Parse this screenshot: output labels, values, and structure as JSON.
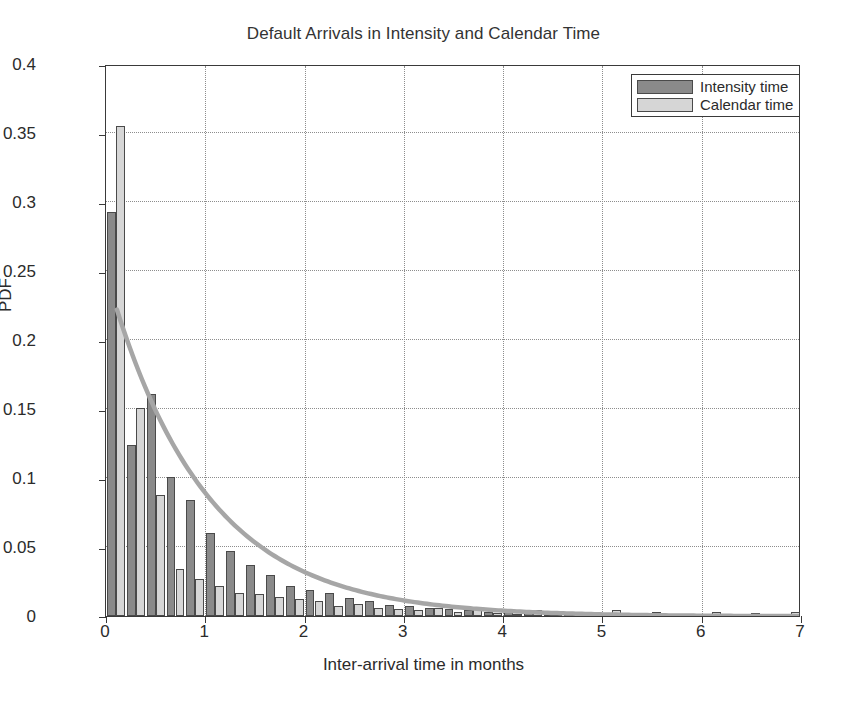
{
  "chart_data": {
    "type": "bar",
    "title": "Default Arrivals in Intensity and Calendar Time",
    "xlabel": "Inter-arrival time in months",
    "ylabel": "PDF",
    "xlim": [
      0,
      7
    ],
    "ylim": [
      0,
      0.4
    ],
    "xticks": [
      "0",
      "1",
      "2",
      "3",
      "4",
      "5",
      "6",
      "7"
    ],
    "xtick_values": [
      0,
      1,
      2,
      3,
      4,
      5,
      6,
      7
    ],
    "yticks": [
      "0",
      "0.05",
      "0.1",
      "0.15",
      "0.2",
      "0.25",
      "0.3",
      "0.35",
      "0.4"
    ],
    "ytick_values": [
      0,
      0.05,
      0.1,
      0.15,
      0.2,
      0.25,
      0.3,
      0.35,
      0.4
    ],
    "grid": true,
    "grid_style": "dotted",
    "bin_width": 0.2,
    "bin_centers": [
      0.1,
      0.3,
      0.5,
      0.7,
      0.9,
      1.1,
      1.3,
      1.5,
      1.7,
      1.9,
      2.1,
      2.3,
      2.5,
      2.7,
      2.9,
      3.1,
      3.3,
      3.5,
      3.7,
      3.9,
      4.1,
      4.3,
      4.5,
      4.7,
      4.9,
      5.1,
      5.3,
      5.5,
      5.7,
      5.9,
      6.1,
      6.3,
      6.5,
      6.7,
      6.9
    ],
    "legend_position": "top-right",
    "series": [
      {
        "name": "Intensity time",
        "color": "#8a8a8a",
        "values": [
          0.293,
          0.124,
          0.161,
          0.101,
          0.084,
          0.06,
          0.047,
          0.037,
          0.03,
          0.022,
          0.019,
          0.017,
          0.013,
          0.011,
          0.008,
          0.007,
          0.006,
          0.005,
          0.004,
          0.003,
          0.003,
          0.002,
          0.002,
          0.002,
          0.001,
          0.001,
          0.001,
          0.001,
          0.001,
          0.001,
          0.0,
          0.0,
          0.0,
          0.0,
          0.0
        ]
      },
      {
        "name": "Calendar time",
        "color": "#d6d6d6",
        "values": [
          0.355,
          0.151,
          0.088,
          0.034,
          0.027,
          0.022,
          0.017,
          0.016,
          0.014,
          0.012,
          0.011,
          0.007,
          0.009,
          0.006,
          0.005,
          0.004,
          0.006,
          0.003,
          0.005,
          0.002,
          0.001,
          0.004,
          0.002,
          0.001,
          0.002,
          0.004,
          0.001,
          0.003,
          0.001,
          0.001,
          0.003,
          0.001,
          0.002,
          0.001,
          0.003
        ]
      }
    ],
    "fit_curve": {
      "name": "exponential-fit",
      "color": "#a6a6a6",
      "x_start": 0.11,
      "x_end": 7.0,
      "y_start": 0.223,
      "decay_rate": 1.02
    }
  },
  "legend": {
    "items": [
      {
        "label": "Intensity time"
      },
      {
        "label": "Calendar time"
      }
    ]
  }
}
